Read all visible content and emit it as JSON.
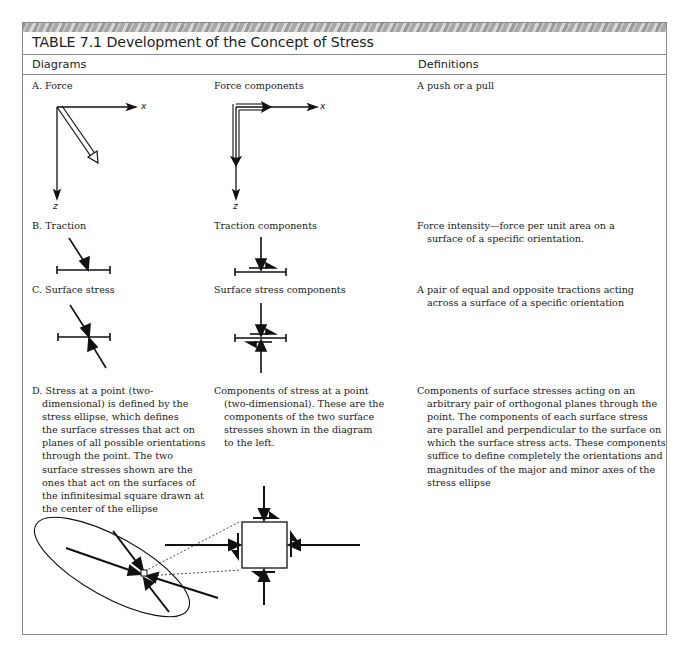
{
  "table": {
    "title": "TABLE 7.1 Development of the Concept of Stress",
    "columns": [
      "Diagrams",
      "Definitions"
    ],
    "rows": [
      {
        "id": "A",
        "diagram_label": "A. Force",
        "components_label": "Force components",
        "definition_lines": [
          "A push or a pull"
        ],
        "axis_labels": {
          "x": "x",
          "z": "z"
        }
      },
      {
        "id": "B",
        "diagram_label": "B. Traction",
        "components_label": "Traction components",
        "definition_lines": [
          "Force intensity—force per unit area on a",
          "surface of a specific orientation."
        ]
      },
      {
        "id": "C",
        "diagram_label": "C. Surface stress",
        "components_label": "Surface stress components",
        "definition_lines": [
          "A pair of equal and opposite tractions acting",
          "across a surface of a specific orientation"
        ]
      },
      {
        "id": "D",
        "diagram_lines": [
          "D. Stress at a point (two-",
          "dimensional) is defined by the",
          "stress ellipse, which defines",
          "the surface stresses that act on",
          "planes of all possible orientations",
          "through the point. The two",
          "surface stresses shown are the",
          "ones that act on the surfaces  of",
          "the infinitesimal square drawn at",
          "the center of the ellipse"
        ],
        "components_lines": [
          "Components of stress at a point",
          "(two-dimensional). These are the",
          "components of the two surface",
          "stresses shown in the diagram",
          "to the left."
        ],
        "definition_lines": [
          "Components of surface stresses acting on an",
          "arbitrary pair of orthogonal planes through the",
          "point. The components of each surface stress",
          "are parallel and perpendicular to the surface on",
          "which the surface stress acts. These components",
          "suffice to define completely the orientations and",
          "magnitudes of the major and minor axes of the",
          "stress ellipse"
        ]
      }
    ]
  }
}
